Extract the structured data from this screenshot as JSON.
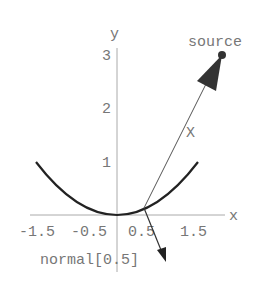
{
  "diagram": {
    "axes": {
      "x_label": "x",
      "y_label": "y"
    },
    "x_ticks": [
      "-1.5",
      "-0.5",
      "0.5",
      "1.5"
    ],
    "y_ticks": [
      "1",
      "2",
      "3"
    ],
    "curve": "y = x^2/2 on [-1.5, 1.5]",
    "source_label": "source",
    "ray_label": "X",
    "normal_label": "normal[0.5]",
    "colors": {
      "axis": "#999999",
      "curve": "#222222",
      "text": "#777777",
      "arrow": "#333333"
    }
  }
}
